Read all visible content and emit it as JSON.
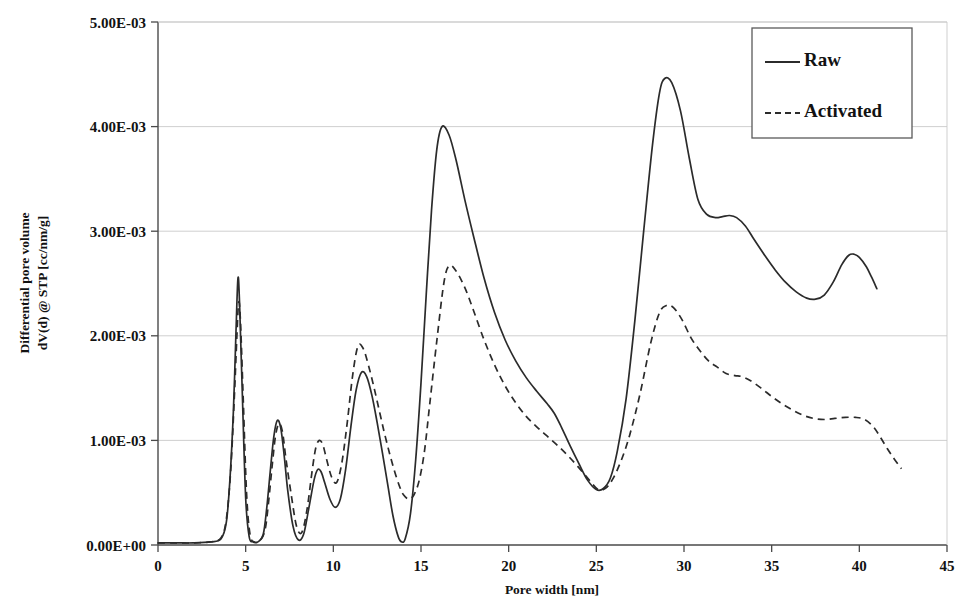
{
  "chart_data": {
    "type": "line",
    "title": "",
    "xlabel": "Pore width [nm]",
    "ylabel_line1": "Differential pore volume",
    "ylabel_line2": "dV(d) @ STP [cc/nm/g]",
    "xlim": [
      0,
      45
    ],
    "ylim": [
      0,
      0.005
    ],
    "xticks": [
      0,
      5,
      10,
      15,
      20,
      25,
      30,
      35,
      40,
      45
    ],
    "xticklabels": [
      "0",
      "5",
      "10",
      "15",
      "20",
      "25",
      "30",
      "35",
      "40",
      "45"
    ],
    "yticks": [
      0,
      0.001,
      0.002,
      0.003,
      0.004,
      0.005
    ],
    "yticklabels": [
      "0.00E+00",
      "1.00E-03",
      "2.00E-03",
      "3.00E-03",
      "4.00E-03",
      "5.00E-03"
    ],
    "grid": "horizontal",
    "legend_position": "top-right",
    "legend": [
      "Raw",
      "Activated"
    ],
    "series": [
      {
        "name": "Raw",
        "style": "solid",
        "color": "#2b2b2b",
        "x": [
          0.0,
          1.0,
          2.0,
          3.0,
          3.6,
          3.9,
          4.1,
          4.3,
          4.45,
          4.56,
          4.65,
          4.8,
          5.0,
          5.2,
          5.4,
          5.7,
          6.0,
          6.2,
          6.4,
          6.6,
          6.8,
          7.0,
          7.2,
          7.4,
          7.7,
          8.0,
          8.3,
          8.6,
          8.9,
          9.1,
          9.3,
          9.5,
          9.8,
          10.1,
          10.4,
          10.7,
          11.0,
          11.3,
          11.6,
          11.9,
          12.2,
          12.5,
          12.8,
          13.1,
          13.4,
          13.7,
          13.9,
          14.1,
          14.4,
          14.7,
          15.0,
          15.3,
          15.6,
          15.9,
          16.2,
          16.6,
          17.0,
          17.5,
          18.0,
          18.6,
          19.2,
          19.8,
          20.4,
          21.0,
          21.6,
          22.2,
          22.6,
          23.0,
          23.5,
          24.0,
          24.5,
          25.0,
          25.4,
          25.8,
          26.2,
          26.7,
          27.2,
          27.7,
          28.2,
          28.6,
          28.9,
          29.3,
          29.8,
          30.3,
          30.8,
          31.3,
          31.8,
          32.2,
          32.6,
          33.0,
          33.5,
          34.0,
          34.6,
          35.2,
          35.8,
          36.4,
          37.0,
          37.5,
          38.0,
          38.5,
          39.0,
          39.4,
          39.7,
          40.0,
          40.4,
          40.7,
          41.0
        ],
        "y": [
          2e-05,
          2e-05,
          2e-05,
          3e-05,
          6e-05,
          0.00022,
          0.00062,
          0.00128,
          0.00205,
          0.00255,
          0.00232,
          0.0015,
          0.00045,
          8e-05,
          3e-05,
          3e-05,
          0.0001,
          0.00035,
          0.0007,
          0.00103,
          0.00119,
          0.00112,
          0.00085,
          0.00052,
          0.00018,
          5e-05,
          0.0001,
          0.00035,
          0.00062,
          0.00072,
          0.0007,
          0.0006,
          0.00044,
          0.00036,
          0.00044,
          0.00072,
          0.00113,
          0.00148,
          0.00165,
          0.00161,
          0.00143,
          0.00117,
          0.00088,
          0.00058,
          0.00028,
          8e-05,
          3e-05,
          6e-05,
          0.0003,
          0.00082,
          0.00155,
          0.0024,
          0.0032,
          0.00378,
          0.004,
          0.00392,
          0.00368,
          0.0033,
          0.00295,
          0.00255,
          0.00222,
          0.00196,
          0.00176,
          0.0016,
          0.00147,
          0.00135,
          0.00126,
          0.00113,
          0.00095,
          0.00078,
          0.00062,
          0.00053,
          0.00054,
          0.00064,
          0.0009,
          0.0014,
          0.00215,
          0.003,
          0.00382,
          0.00432,
          0.00446,
          0.00442,
          0.00415,
          0.0037,
          0.0033,
          0.00316,
          0.00313,
          0.00314,
          0.00315,
          0.00313,
          0.00305,
          0.00292,
          0.00277,
          0.00263,
          0.00251,
          0.00242,
          0.00236,
          0.00235,
          0.00239,
          0.00251,
          0.00268,
          0.00277,
          0.00278,
          0.00275,
          0.00266,
          0.00256,
          0.00245
        ]
      },
      {
        "name": "Activated",
        "style": "dashed",
        "color": "#2b2b2b",
        "x": [
          0.0,
          1.0,
          2.0,
          3.0,
          3.6,
          3.9,
          4.15,
          4.35,
          4.5,
          4.6,
          4.7,
          4.85,
          5.05,
          5.25,
          5.5,
          5.8,
          6.1,
          6.3,
          6.5,
          6.7,
          6.9,
          7.1,
          7.3,
          7.6,
          7.9,
          8.2,
          8.5,
          8.8,
          9.0,
          9.2,
          9.4,
          9.6,
          9.9,
          10.2,
          10.5,
          10.8,
          11.1,
          11.4,
          11.7,
          12.0,
          12.3,
          12.6,
          12.9,
          13.2,
          13.5,
          13.8,
          14.0,
          14.3,
          14.6,
          14.9,
          15.2,
          15.5,
          15.9,
          16.3,
          16.6,
          17.0,
          17.5,
          18.0,
          18.6,
          19.2,
          19.8,
          20.4,
          21.0,
          21.6,
          22.2,
          22.8,
          23.4,
          24.0,
          24.6,
          25.1,
          25.5,
          25.9,
          26.4,
          26.9,
          27.5,
          28.1,
          28.6,
          29.0,
          29.4,
          29.9,
          30.4,
          30.9,
          31.4,
          31.9,
          32.4,
          32.9,
          33.3,
          33.8,
          34.4,
          35.0,
          35.6,
          36.2,
          36.8,
          37.4,
          38.0,
          38.6,
          39.2,
          39.8,
          40.3,
          40.8,
          41.2,
          41.6,
          42.0,
          42.4
        ],
        "y": [
          2e-05,
          2e-05,
          2e-05,
          3e-05,
          7e-05,
          0.00025,
          0.00072,
          0.0014,
          0.002,
          0.00232,
          0.00215,
          0.00145,
          0.0005,
          0.0001,
          3e-05,
          4e-05,
          0.00014,
          0.0004,
          0.00074,
          0.00104,
          0.00116,
          0.00108,
          0.00082,
          0.00048,
          0.00018,
          0.00012,
          0.00034,
          0.00072,
          0.00093,
          0.001,
          0.00096,
          0.00083,
          0.00065,
          0.0006,
          0.0008,
          0.00118,
          0.00162,
          0.0019,
          0.00188,
          0.00172,
          0.00152,
          0.0013,
          0.00108,
          0.00088,
          0.0007,
          0.00055,
          0.00048,
          0.00044,
          0.00048,
          0.00062,
          0.0009,
          0.00135,
          0.00195,
          0.0025,
          0.00267,
          0.00262,
          0.00246,
          0.00224,
          0.00196,
          0.00172,
          0.00152,
          0.00136,
          0.00123,
          0.00113,
          0.00104,
          0.00095,
          0.00085,
          0.00074,
          0.00062,
          0.00053,
          0.00054,
          0.00062,
          0.0008,
          0.00105,
          0.00145,
          0.00193,
          0.00222,
          0.00229,
          0.00227,
          0.00215,
          0.00198,
          0.00186,
          0.00176,
          0.0017,
          0.00164,
          0.00162,
          0.00161,
          0.00157,
          0.0015,
          0.00142,
          0.00135,
          0.00129,
          0.00124,
          0.00121,
          0.0012,
          0.00121,
          0.00122,
          0.00122,
          0.0012,
          0.00113,
          0.00103,
          0.00092,
          0.00082,
          0.00073
        ]
      }
    ]
  }
}
